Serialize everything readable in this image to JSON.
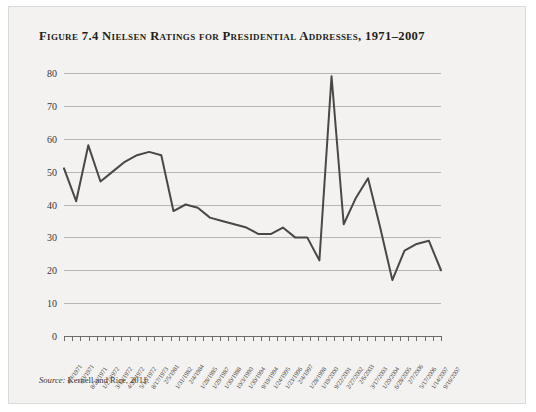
{
  "figure": {
    "title": "Figure 7.4 Nielsen Ratings for Presidential Addresses, 1971–2007",
    "source_label": "Source:",
    "source_text": " Kernell and Rice, 2011."
  },
  "style": {
    "page_background": "#f3f2f0",
    "line_color": "#4a4845",
    "grid_color": "#b8b6b3",
    "axis_color": "#6e6b68",
    "text_color": "#231f20"
  },
  "chart_data": {
    "type": "line",
    "title": "Figure 7.4 Nielsen Ratings for Presidential Addresses, 1971–2007",
    "xlabel": "",
    "ylabel": "",
    "ylim": [
      0,
      80
    ],
    "yticks": [
      0,
      10,
      20,
      30,
      40,
      50,
      60,
      70,
      80
    ],
    "grid": true,
    "legend": "none",
    "categories": [
      "4/7/1971",
      "5/3/1971",
      "8/22/1971",
      "1/27/1972",
      "3/19/1972",
      "4/29/1972",
      "5/10/1972",
      "8/17/1973",
      "2/5/1981",
      "1/31/1982",
      "2/4/1984",
      "1/28/1985",
      "1/29/1987",
      "1/30/1988",
      "10/3/1990",
      "1/30/1994",
      "9/19/1994",
      "1/24/1995",
      "1/23/1996",
      "2/4/1997",
      "1/28/1998",
      "1/19/2000",
      "9/22/2001",
      "2/27/2002",
      "2/6/2003",
      "3/17/2003",
      "1/20/2004",
      "6/28/2005",
      "2/7/2006",
      "5/17/2006",
      "1/14/2007",
      "9/16/2007"
    ],
    "values": [
      51,
      41,
      58,
      47,
      50,
      53,
      55,
      56,
      55,
      38,
      40,
      39,
      36,
      35,
      34,
      33,
      31,
      31,
      33,
      30,
      30,
      23,
      79,
      34,
      42,
      48,
      33,
      17,
      26,
      28,
      29,
      20
    ],
    "tick_count": 47,
    "series": [
      {
        "name": "Nielsen rating",
        "values": [
          51,
          41,
          58,
          47,
          50,
          53,
          55,
          56,
          55,
          38,
          40,
          39,
          36,
          35,
          34,
          33,
          31,
          31,
          33,
          30,
          30,
          23,
          79,
          34,
          42,
          48,
          33,
          17,
          26,
          28,
          29,
          20
        ]
      }
    ]
  }
}
